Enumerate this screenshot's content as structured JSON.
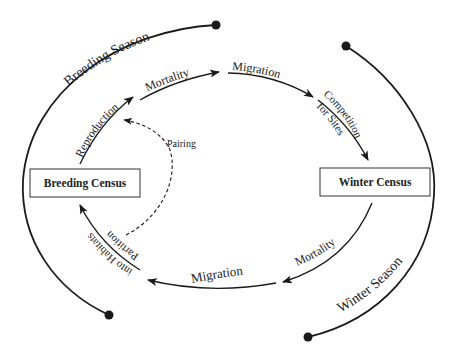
{
  "diagram": {
    "seasons": {
      "breeding": "Breeding Season",
      "winter": "Winter Season"
    },
    "nodes": {
      "breeding_census": "Breeding Census",
      "winter_census": "Winter Census"
    },
    "flows": {
      "reproduction": "Reproduction",
      "mortality_top": "Mortality",
      "migration_top": "Migration",
      "competition_line1": "Competition",
      "competition_line2": "for Sites",
      "mortality_bottom": "Mortality",
      "migration_bottom": "Migration",
      "partition_line1": "Partition",
      "partition_line2": "into Habitats",
      "pairing": "Pairing"
    },
    "colors": {
      "stroke": "#1a1a1a",
      "background": "#ffffff"
    }
  }
}
